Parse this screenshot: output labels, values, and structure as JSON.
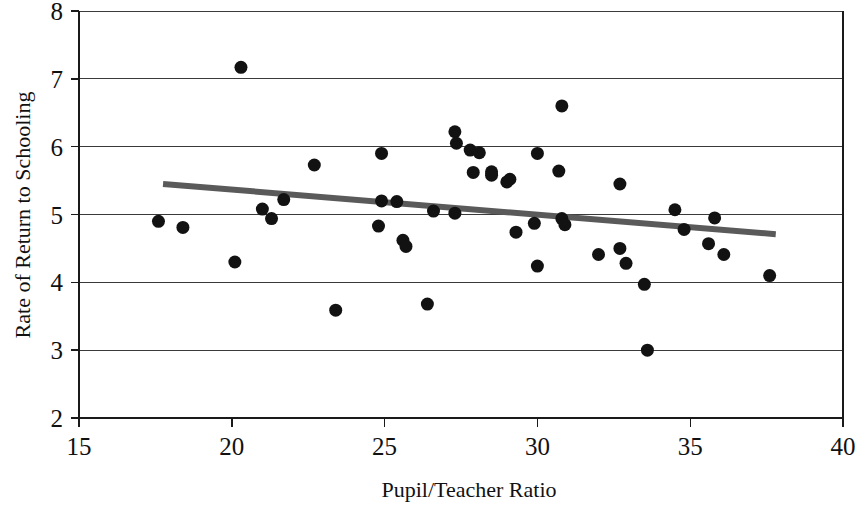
{
  "chart_data": {
    "type": "scatter",
    "title": "",
    "xlabel": "Pupil/Teacher Ratio",
    "ylabel": "Rate of Return to Schooling",
    "xlim": [
      15,
      40
    ],
    "ylim": [
      2,
      8
    ],
    "xticks": [
      15,
      20,
      25,
      30,
      35,
      40
    ],
    "yticks": [
      2,
      3,
      4,
      5,
      6,
      7,
      8
    ],
    "xtick_labels": [
      "15",
      "20",
      "25",
      "30",
      "35",
      "40"
    ],
    "ytick_labels": [
      "2",
      "3",
      "4",
      "5",
      "6",
      "7",
      "8"
    ],
    "grid": "horizontal",
    "legend": "none",
    "marker": "filled-circle",
    "marker_color": "#121212",
    "marker_size_px": 13,
    "points": [
      {
        "x": 17.6,
        "y": 4.9
      },
      {
        "x": 18.4,
        "y": 4.81
      },
      {
        "x": 20.3,
        "y": 7.17
      },
      {
        "x": 20.1,
        "y": 4.3
      },
      {
        "x": 21.0,
        "y": 5.08
      },
      {
        "x": 21.3,
        "y": 4.94
      },
      {
        "x": 21.7,
        "y": 5.22
      },
      {
        "x": 22.7,
        "y": 5.73
      },
      {
        "x": 23.4,
        "y": 3.59
      },
      {
        "x": 24.8,
        "y": 4.83
      },
      {
        "x": 24.9,
        "y": 5.9
      },
      {
        "x": 24.9,
        "y": 5.2
      },
      {
        "x": 25.4,
        "y": 5.19
      },
      {
        "x": 25.6,
        "y": 4.62
      },
      {
        "x": 25.7,
        "y": 4.53
      },
      {
        "x": 26.6,
        "y": 5.05
      },
      {
        "x": 26.4,
        "y": 3.68
      },
      {
        "x": 27.3,
        "y": 6.22
      },
      {
        "x": 27.35,
        "y": 6.05
      },
      {
        "x": 27.3,
        "y": 5.02
      },
      {
        "x": 27.8,
        "y": 5.95
      },
      {
        "x": 28.1,
        "y": 5.91
      },
      {
        "x": 27.9,
        "y": 5.62
      },
      {
        "x": 28.5,
        "y": 5.63
      },
      {
        "x": 28.5,
        "y": 5.58
      },
      {
        "x": 29.1,
        "y": 5.52
      },
      {
        "x": 29.0,
        "y": 5.48
      },
      {
        "x": 29.3,
        "y": 4.74
      },
      {
        "x": 30.0,
        "y": 5.9
      },
      {
        "x": 29.9,
        "y": 4.87
      },
      {
        "x": 30.0,
        "y": 4.24
      },
      {
        "x": 30.8,
        "y": 6.6
      },
      {
        "x": 30.7,
        "y": 5.64
      },
      {
        "x": 30.8,
        "y": 4.94
      },
      {
        "x": 30.9,
        "y": 4.85
      },
      {
        "x": 32.0,
        "y": 4.41
      },
      {
        "x": 32.7,
        "y": 5.45
      },
      {
        "x": 32.7,
        "y": 4.5
      },
      {
        "x": 32.9,
        "y": 4.28
      },
      {
        "x": 33.5,
        "y": 3.97
      },
      {
        "x": 33.6,
        "y": 3.0
      },
      {
        "x": 34.5,
        "y": 5.07
      },
      {
        "x": 34.8,
        "y": 4.78
      },
      {
        "x": 35.6,
        "y": 4.57
      },
      {
        "x": 35.8,
        "y": 4.95
      },
      {
        "x": 36.1,
        "y": 4.41
      },
      {
        "x": 37.6,
        "y": 4.1
      }
    ],
    "trend_line": {
      "x_start": 17.75,
      "y_start": 5.45,
      "x_end": 37.8,
      "y_end": 4.71,
      "color": "#5a5a5a",
      "width_px": 6
    }
  }
}
